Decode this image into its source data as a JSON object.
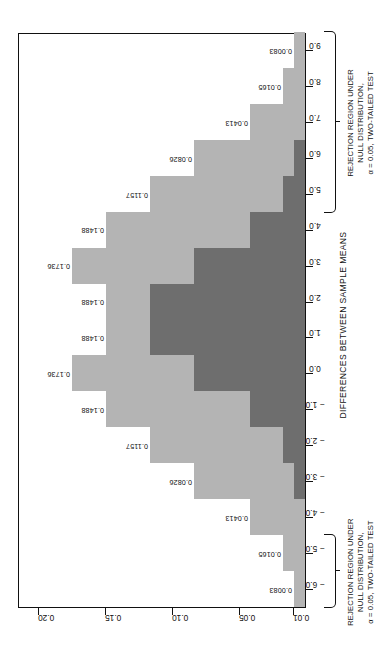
{
  "chart_data": {
    "type": "bar",
    "title": "",
    "xlabel": "DIFFERENCES BETWEEN SAMPLE MEANS",
    "ylabel": "",
    "xlim": [
      -6.5,
      9.5
    ],
    "ylim": [
      0,
      0.215
    ],
    "grid": false,
    "legend_position": "top",
    "x_ticks": [
      "-6.0",
      "-5.0",
      "-4.0",
      "-3.0",
      "-2.0",
      "-1.0",
      "0.0",
      "1.0",
      "2.0",
      "3.0",
      "4.0",
      "5.0",
      "6.0",
      "7.0",
      "8.0",
      "9.0"
    ],
    "x_tick_values": [
      -6,
      -5,
      -4,
      -3,
      -2,
      -1,
      0,
      1,
      2,
      3,
      4,
      5,
      6,
      7,
      8,
      9
    ],
    "y_ticks": [
      "0.01",
      "0.05",
      "0.10",
      "0.15",
      "0.20"
    ],
    "y_tick_values": [
      0.01,
      0.05,
      0.1,
      0.15,
      0.2
    ],
    "series": [
      {
        "name": "null",
        "label": "Distribution of X1bar - X2bar under H0",
        "color": "#b4b4b4",
        "centers": [
          -6,
          -5,
          -4,
          -3,
          -2,
          -1,
          0,
          1,
          2,
          3,
          4,
          5,
          6
        ],
        "values": [
          0.0083,
          0.0165,
          0.0413,
          0.0826,
          0.1157,
          0.1488,
          0.1736,
          0.1488,
          0.1157,
          0.0826,
          0.0413,
          0.0165,
          0.0083
        ]
      },
      {
        "name": "true",
        "label": "True distribution of X1bar - X2bar",
        "color": "#9a9a9a",
        "centers": [
          -3,
          -2,
          -1,
          0,
          1,
          2,
          3,
          4,
          5,
          6,
          7,
          8,
          9
        ],
        "values": [
          0.0083,
          0.0165,
          0.0413,
          0.0826,
          0.1157,
          0.1488,
          0.1736,
          0.1488,
          0.1157,
          0.0826,
          0.0413,
          0.0165,
          0.0083
        ]
      }
    ],
    "overlap_color": "#6e6e6e",
    "bar_labels_left": [
      "0.0083",
      "0.0165",
      "0.0413",
      "0.0826",
      "0.1157",
      "0.1488",
      "0.1736",
      "0.1488"
    ],
    "bar_labels_right": [
      "0.1488",
      "0.1736",
      "0.1488",
      "0.1157",
      "0.0826",
      "0.0413",
      "0.0165",
      "0.0083"
    ]
  },
  "legend": {
    "items": [
      {
        "swatch": "light-gray",
        "line1": "DISTRIBUTION OF",
        "line2": "UNDER",
        "line3": ""
      },
      {
        "swatch": "dark-gray",
        "line1": "OVERLAP OF THE",
        "line2": "TWO DISTRIBUTIONS",
        "line3": ""
      },
      {
        "swatch": "mid-gray",
        "line1": "TRUE DISTRIBUTION",
        "line2": "OF",
        "line3": ""
      }
    ],
    "null_line1": "DISTRIBUTION OF",
    "null_under": "UNDER",
    "overlap_line1": "OVERLAP OF THE",
    "overlap_line2": "TWO DISTRIBUTIONS",
    "true_line1": "TRUE DISTRIBUTION",
    "true_line2_prefix": "OF"
  },
  "annotations": {
    "rejection_left": "REJECTION REGION UNDER\nNULL DISTRIBUTION,\nα = 0.05, TWO-TAILED TEST",
    "rejection_right": "REJECTION REGION UNDER\nNULL DISTRIBUTION,\nα = 0.05, TWO-TAILED TEST"
  },
  "axis": {
    "x_title": "DIFFERENCES BETWEEN SAMPLE MEANS"
  },
  "colors": {
    "light": "#b4b4b4",
    "mid": "#9a9a9a",
    "dark": "#6e6e6e",
    "ink": "#111111",
    "background": "#ffffff"
  }
}
